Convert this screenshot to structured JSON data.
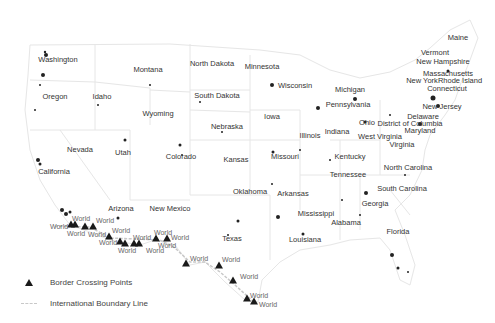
{
  "map": {
    "type": "US map of cities with border crossing points",
    "colors": {
      "state_outline": "#e6e6e6",
      "city_dots": "#222222",
      "crossing_marker": "#1a1a1a",
      "boundary_line": "#c8c8c8",
      "state_label": "#333333",
      "world_label": "#666666"
    },
    "states": [
      {
        "name": "Washington",
        "x": 58,
        "y": 60
      },
      {
        "name": "Oregon",
        "x": 55,
        "y": 97
      },
      {
        "name": "Idaho",
        "x": 102,
        "y": 97
      },
      {
        "name": "Montana",
        "x": 148,
        "y": 70
      },
      {
        "name": "Wyoming",
        "x": 158,
        "y": 114
      },
      {
        "name": "North Dakota",
        "x": 212,
        "y": 64
      },
      {
        "name": "South Dakota",
        "x": 217,
        "y": 96
      },
      {
        "name": "Nebraska",
        "x": 227,
        "y": 127
      },
      {
        "name": "Minnesota",
        "x": 262,
        "y": 67
      },
      {
        "name": "Wisconsin",
        "x": 295,
        "y": 86
      },
      {
        "name": "Iowa",
        "x": 272,
        "y": 117
      },
      {
        "name": "Michigan",
        "x": 350,
        "y": 90
      },
      {
        "name": "Pennsylvania",
        "x": 348,
        "y": 105
      },
      {
        "name": "Ohio",
        "x": 367,
        "y": 123
      },
      {
        "name": "Illinois",
        "x": 310,
        "y": 136
      },
      {
        "name": "Indiana",
        "x": 337,
        "y": 132
      },
      {
        "name": "West Virginia",
        "x": 380,
        "y": 137
      },
      {
        "name": "Nevada",
        "x": 80,
        "y": 150
      },
      {
        "name": "Utah",
        "x": 123,
        "y": 153
      },
      {
        "name": "Colorado",
        "x": 181,
        "y": 157
      },
      {
        "name": "Kansas",
        "x": 236,
        "y": 160
      },
      {
        "name": "Missouri",
        "x": 285,
        "y": 157
      },
      {
        "name": "Kentucky",
        "x": 350,
        "y": 157
      },
      {
        "name": "Virginia",
        "x": 402,
        "y": 145
      },
      {
        "name": "California",
        "x": 54,
        "y": 172
      },
      {
        "name": "Tennessee",
        "x": 348,
        "y": 175
      },
      {
        "name": "North Carolina",
        "x": 408,
        "y": 168
      },
      {
        "name": "Oklahoma",
        "x": 250,
        "y": 192
      },
      {
        "name": "Arkansas",
        "x": 293,
        "y": 194
      },
      {
        "name": "South Carolina",
        "x": 402,
        "y": 189
      },
      {
        "name": "Georgia",
        "x": 375,
        "y": 204
      },
      {
        "name": "Arizona",
        "x": 121,
        "y": 209
      },
      {
        "name": "New Mexico",
        "x": 170,
        "y": 209
      },
      {
        "name": "Mississippi",
        "x": 316,
        "y": 214
      },
      {
        "name": "Alabama",
        "x": 346,
        "y": 223
      },
      {
        "name": "Texas",
        "x": 232,
        "y": 239
      },
      {
        "name": "Florida",
        "x": 398,
        "y": 232
      },
      {
        "name": "Louisiana",
        "x": 305,
        "y": 240
      },
      {
        "name": "Maine",
        "x": 458,
        "y": 38
      },
      {
        "name": "Vermont",
        "x": 435,
        "y": 53
      },
      {
        "name": "New Hampshire",
        "x": 443,
        "y": 62
      },
      {
        "name": "Massachusetts",
        "x": 448,
        "y": 74
      },
      {
        "name": "New York",
        "x": 422,
        "y": 81
      },
      {
        "name": "Rhode Island",
        "x": 460,
        "y": 81
      },
      {
        "name": "Connecticut",
        "x": 447,
        "y": 89
      },
      {
        "name": "New Jersey",
        "x": 442,
        "y": 107
      },
      {
        "name": "Delaware",
        "x": 423,
        "y": 117
      },
      {
        "name": "District of Columbia",
        "x": 410,
        "y": 124
      },
      {
        "name": "Maryland",
        "x": 420,
        "y": 131
      }
    ],
    "crossings": [
      {
        "x": 71,
        "y": 224
      },
      {
        "x": 75,
        "y": 224
      },
      {
        "x": 85,
        "y": 226
      },
      {
        "x": 93,
        "y": 226
      },
      {
        "x": 109,
        "y": 236
      },
      {
        "x": 120,
        "y": 241
      },
      {
        "x": 125,
        "y": 243
      },
      {
        "x": 134,
        "y": 243
      },
      {
        "x": 139,
        "y": 243
      },
      {
        "x": 156,
        "y": 238
      },
      {
        "x": 167,
        "y": 238
      },
      {
        "x": 186,
        "y": 263
      },
      {
        "x": 219,
        "y": 265
      },
      {
        "x": 233,
        "y": 280
      },
      {
        "x": 247,
        "y": 298
      },
      {
        "x": 254,
        "y": 301
      }
    ],
    "world_labels": [
      {
        "text": "World",
        "x": 72,
        "y": 215
      },
      {
        "text": "World",
        "x": 50,
        "y": 223
      },
      {
        "text": "World",
        "x": 67,
        "y": 230
      },
      {
        "text": "World",
        "x": 96,
        "y": 217
      },
      {
        "text": "World",
        "x": 88,
        "y": 231
      },
      {
        "text": "World",
        "x": 112,
        "y": 227
      },
      {
        "text": "World",
        "x": 99,
        "y": 239
      },
      {
        "text": "World",
        "x": 133,
        "y": 234
      },
      {
        "text": "World",
        "x": 118,
        "y": 247
      },
      {
        "text": "World",
        "x": 146,
        "y": 247
      },
      {
        "text": "World",
        "x": 154,
        "y": 229
      },
      {
        "text": "World",
        "x": 171,
        "y": 234
      },
      {
        "text": "World",
        "x": 158,
        "y": 242
      },
      {
        "text": "World",
        "x": 190,
        "y": 255
      },
      {
        "text": "World",
        "x": 222,
        "y": 256
      },
      {
        "text": "World",
        "x": 240,
        "y": 273
      },
      {
        "text": "World",
        "x": 250,
        "y": 292
      },
      {
        "text": "World",
        "x": 259,
        "y": 301
      }
    ]
  },
  "legend": {
    "items": [
      {
        "symbol": "triangle",
        "label": "Border Crossing Points"
      },
      {
        "symbol": "dashed-line",
        "label": "International Boundary Line"
      }
    ]
  }
}
